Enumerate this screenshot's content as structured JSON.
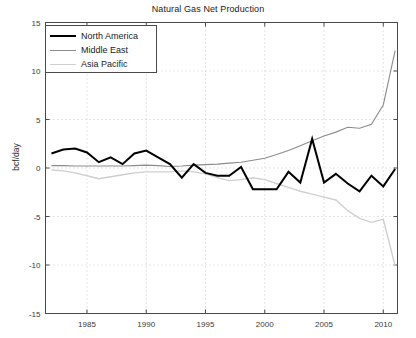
{
  "chart_data": {
    "type": "line",
    "title": "Natural Gas Net Production",
    "xlabel": "",
    "ylabel": "bcf/day",
    "xlim": [
      1981.5,
      2011.2
    ],
    "ylim": [
      -15,
      15
    ],
    "grid": true,
    "grid_style": "dotted",
    "legend_position": "upper-left",
    "xticks": [
      1985,
      1990,
      1995,
      2000,
      2005,
      2010
    ],
    "xtick_labels": [
      "1985",
      "1990",
      "1995",
      "2000",
      "2005",
      "2010"
    ],
    "yticks": [
      -15,
      -10,
      -5,
      0,
      5,
      10,
      15
    ],
    "ytick_labels": [
      "-15",
      "-10",
      "-5",
      "0",
      "5",
      "10",
      "15"
    ],
    "x": [
      1982,
      1983,
      1984,
      1985,
      1986,
      1987,
      1988,
      1989,
      1990,
      1991,
      1992,
      1993,
      1994,
      1995,
      1996,
      1997,
      1998,
      1999,
      2000,
      2001,
      2002,
      2003,
      2004,
      2005,
      2006,
      2007,
      2008,
      2009,
      2010,
      2011
    ],
    "series": [
      {
        "name": "North America",
        "color": "#000000",
        "width": 2.0,
        "values": [
          1.5,
          1.9,
          2.0,
          1.6,
          0.6,
          1.1,
          0.4,
          1.5,
          1.8,
          1.1,
          0.4,
          -1.0,
          0.4,
          -0.5,
          -0.8,
          -0.8,
          0.1,
          -2.2,
          -2.2,
          -2.2,
          -0.4,
          -1.5,
          3.0,
          -1.5,
          -0.6,
          -1.6,
          -2.4,
          -0.8,
          -1.9,
          -0.1
        ]
      },
      {
        "name": "Middle East",
        "color": "#8c8c8c",
        "width": 1.1,
        "values": [
          0.25,
          0.25,
          0.2,
          0.2,
          0.2,
          0.2,
          0.2,
          0.25,
          0.3,
          0.25,
          0.15,
          0.2,
          0.3,
          0.35,
          0.4,
          0.5,
          0.6,
          0.8,
          1.0,
          1.4,
          1.8,
          2.3,
          2.8,
          3.3,
          3.7,
          4.2,
          4.1,
          4.5,
          6.5,
          12.1
        ]
      },
      {
        "name": "Asia Pacific",
        "color": "#cfcfcf",
        "width": 1.4,
        "values": [
          -0.2,
          -0.3,
          -0.5,
          -0.8,
          -1.1,
          -0.9,
          -0.7,
          -0.5,
          -0.4,
          -0.4,
          -0.4,
          -0.3,
          -0.4,
          -0.6,
          -1.0,
          -1.3,
          -1.2,
          -1.0,
          -1.2,
          -1.6,
          -2.0,
          -2.4,
          -2.7,
          -3.0,
          -3.3,
          -4.4,
          -5.2,
          -5.6,
          -5.3,
          -10.1
        ]
      }
    ]
  },
  "legend": {
    "items": [
      {
        "label": "North America"
      },
      {
        "label": "Middle East"
      },
      {
        "label": "Asia Pacific"
      }
    ]
  },
  "axes": {
    "ylabel": "bcf/day",
    "title": "Natural Gas Net Production"
  }
}
